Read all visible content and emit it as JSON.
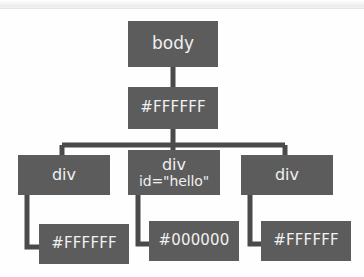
{
  "diagram": {
    "node_fill_color": "#5c5c5c",
    "node_text_color": "#f0f0f0",
    "connector_color": "#4a4a4a",
    "background_color": "#fefefe",
    "nodes": [
      {
        "id": "root-body",
        "label": "body",
        "lines": [
          "body"
        ],
        "level": "root",
        "x": 128,
        "y": 21,
        "w": 90,
        "h": 46
      },
      {
        "id": "body-color",
        "label": "#FFFFFF",
        "lines": [
          "#FFFFFF"
        ],
        "level": "value",
        "x": 128,
        "y": 87,
        "w": 90,
        "h": 42
      },
      {
        "id": "div-left",
        "label": "div",
        "lines": [
          "div"
        ],
        "level": "element",
        "x": 18,
        "y": 155,
        "w": 92,
        "h": 40
      },
      {
        "id": "div-hello",
        "label": "div id=\"hello\"",
        "lines": [
          "div",
          "id=\"hello\""
        ],
        "level": "element",
        "x": 128,
        "y": 150,
        "w": 92,
        "h": 45
      },
      {
        "id": "div-right",
        "label": "div",
        "lines": [
          "div"
        ],
        "level": "element",
        "x": 241,
        "y": 155,
        "w": 92,
        "h": 40
      },
      {
        "id": "div-left-color",
        "label": "#FFFFFF",
        "lines": [
          "#FFFFFF"
        ],
        "level": "value",
        "x": 39,
        "y": 224,
        "w": 90,
        "h": 40
      },
      {
        "id": "div-hello-color",
        "label": "#000000",
        "lines": [
          "#000000"
        ],
        "level": "value",
        "x": 149,
        "y": 221,
        "w": 90,
        "h": 40
      },
      {
        "id": "div-right-color",
        "label": "#FFFFFF",
        "lines": [
          "#FFFFFF"
        ],
        "level": "value",
        "x": 261,
        "y": 221,
        "w": 90,
        "h": 40
      }
    ],
    "edges": [
      {
        "id": "edge-body-to-color",
        "from": "root-body",
        "to": "body-color",
        "kind": "vertical"
      },
      {
        "id": "edge-color-to-div-left",
        "from": "body-color",
        "to": "div-left",
        "kind": "bus-left"
      },
      {
        "id": "edge-color-to-div-hello",
        "from": "body-color",
        "to": "div-hello",
        "kind": "bus-center"
      },
      {
        "id": "edge-color-to-div-right",
        "from": "body-color",
        "to": "div-right",
        "kind": "bus-right"
      },
      {
        "id": "edge-div-left-to-color",
        "from": "div-left",
        "to": "div-left-color",
        "kind": "elbow"
      },
      {
        "id": "edge-div-hello-to-color",
        "from": "div-hello",
        "to": "div-hello-color",
        "kind": "elbow"
      },
      {
        "id": "edge-div-right-to-color",
        "from": "div-right",
        "to": "div-right-color",
        "kind": "elbow"
      }
    ]
  }
}
